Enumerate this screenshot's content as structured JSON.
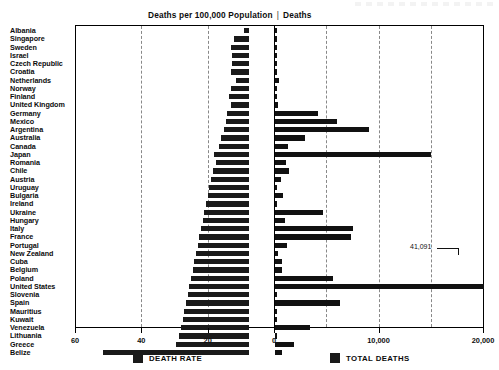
{
  "header": {
    "left_title": "Deaths per 100,000 Population",
    "divider": "|",
    "right_title": "Deaths"
  },
  "legend": {
    "death_rate": "DEATH RATE",
    "total_deaths": "TOTAL DEATHS"
  },
  "annotations": {
    "us_total_deaths": "41,091"
  },
  "axes": {
    "left_ticks": [
      "60",
      "40",
      "20",
      "0"
    ],
    "right_ticks": [
      "0",
      "10,000",
      "20,000"
    ]
  },
  "chart_data": {
    "type": "bar",
    "orientation": "horizontal",
    "layout": "butterfly",
    "grid": true,
    "legend_position": "bottom",
    "categories": [
      "Albania",
      "Singapore",
      "Sweden",
      "Israel",
      "Czech Republic",
      "Croatia",
      "Netherlands",
      "Norway",
      "Finland",
      "United Kingdom",
      "Germany",
      "Mexico",
      "Argentina",
      "Australia",
      "Canada",
      "Japan",
      "Romania",
      "Chile",
      "Austria",
      "Uruguay",
      "Bulgaria",
      "Ireland",
      "Ukraine",
      "Hungary",
      "Italy",
      "France",
      "Portugal",
      "New Zealand",
      "Cuba",
      "Belgium",
      "Poland",
      "United States",
      "Slovenia",
      "Spain",
      "Mauritius",
      "Kuwait",
      "Venezuela",
      "Lithuania",
      "Greece",
      "Belize"
    ],
    "series": [
      {
        "name": "DEATH RATE",
        "xlabel": "Deaths per 100,000 Population",
        "xlim": [
          60,
          0
        ],
        "direction": "left",
        "values": [
          1.5,
          4.5,
          5.5,
          5.0,
          5.0,
          5.5,
          4.0,
          5.5,
          6.0,
          5.5,
          6.5,
          7.0,
          7.5,
          8.5,
          9.0,
          10.5,
          10.0,
          11.0,
          11.5,
          12.0,
          12.5,
          13.0,
          13.5,
          14.0,
          14.5,
          15.0,
          15.5,
          16.0,
          16.5,
          17.0,
          17.5,
          18.0,
          18.5,
          19.0,
          19.5,
          20.0,
          20.5,
          21.0,
          22.0,
          44.0
        ]
      },
      {
        "name": "TOTAL DEATHS",
        "xlabel": "Deaths",
        "xlim": [
          0,
          20000
        ],
        "direction": "right",
        "values": [
          45,
          160,
          190,
          210,
          260,
          140,
          400,
          120,
          220,
          330,
          4200,
          6000,
          9000,
          2900,
          1300,
          15000,
          1100,
          1350,
          600,
          230,
          800,
          260,
          4600,
          1000,
          7500,
          7300,
          1200,
          330,
          700,
          740,
          5600,
          41091,
          170,
          6300,
          120,
          160,
          3400,
          280,
          1900,
          700
        ]
      }
    ]
  }
}
